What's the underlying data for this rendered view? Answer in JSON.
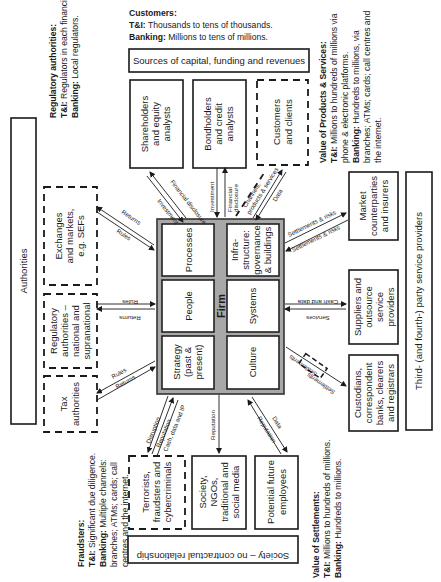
{
  "orientation": "rotated-90-counterclockwise",
  "notes": {
    "customers": {
      "title": "Customers:",
      "line1_bold": "T&I:",
      "line1": " Thousands to tens of thousands.",
      "line2_bold": "Banking:",
      "line2": " Millions to tens of millions."
    },
    "regulatory": {
      "title": "Regulatory authorities:",
      "line1_bold": "T&I:",
      "line1": " Regulators in each financial centre.",
      "line2_bold": "Banking:",
      "line2": " Local regulators."
    },
    "products": {
      "title": "Value of Products & Services:",
      "line1_bold": "T&I:",
      "line1": " Millions to hundreds of millions via",
      "line2": "phone & electronic platforms.",
      "line3_bold": "Banking:",
      "line3": " Hundreds to millions, via",
      "line4": "branches; ATMs; cards; call centres and",
      "line5": "the internet."
    },
    "fraudsters": {
      "title": "Fraudsters:",
      "line1_bold": "T&I:",
      "line1": " Significant due diligence.",
      "line2_bold": "Banking:",
      "line2": " Multiple channels:",
      "line3": "branches; ATMs; cards; call",
      "line4": "centres and the internet."
    },
    "settlements": {
      "title": "Value of Settlements:",
      "line1_bold": "T&I:",
      "line1": " Millions to hundreds of millions.",
      "line2_bold": "Banking:",
      "line2": " Hundreds to millions."
    }
  },
  "groups": {
    "sources": "Sources of capital, funding and revenues",
    "authorities": "Authorities",
    "third_party": "Third- (and fourth-) party service providers",
    "society": "Society – no contractual relationship"
  },
  "entities": {
    "shareholders": [
      "Shareholders",
      "and equity",
      "analysts"
    ],
    "bondholders": [
      "Bondholders",
      "and credit",
      "analysts"
    ],
    "customers": [
      "Customers",
      "and clients"
    ],
    "exchanges": [
      "Exchanges",
      "and markets,",
      "e.g. SEFs"
    ],
    "regulators": [
      "Regulatory",
      "authorities –",
      "national and",
      "supranational"
    ],
    "tax": [
      "Tax",
      "authorities"
    ],
    "market": [
      "Market",
      "counterparties",
      "and insurers"
    ],
    "suppliers": [
      "Suppliers and",
      "outsource",
      "service",
      "providers"
    ],
    "custodians": [
      "Custodians,",
      "correspondent",
      "banks, clearers",
      "and registrars"
    ],
    "terrorists": [
      "Terrorists,",
      "fraudsters and",
      "cybercriminals"
    ],
    "society_media": [
      "Society,",
      "NGOs,",
      "traditional and",
      "social media"
    ],
    "employees": [
      "Potential future",
      "employees"
    ]
  },
  "firm": {
    "label": "Firm",
    "cells": {
      "processes": [
        "Processes"
      ],
      "infrastructure": [
        "Infra-",
        "structure:",
        "governance",
        "& buildings"
      ],
      "people": [
        "People"
      ],
      "systems": [
        "Systems"
      ],
      "strategy": [
        "Strategy",
        "(past &",
        "present)"
      ],
      "culture": [
        "Culture"
      ]
    }
  },
  "flows": {
    "shareholders": [
      "Investment",
      "Financial disclosure"
    ],
    "bondholders": [
      "Investment",
      "Financial",
      "disclosure"
    ],
    "customers": [
      "Channels,",
      "products & services",
      "Data"
    ],
    "exchanges": [
      "Returns",
      "Rules"
    ],
    "regulators": [
      "Rules",
      "Returns"
    ],
    "tax": [
      "Rules",
      "Returns"
    ],
    "market": [
      "Settlements & risks",
      "Settlements & risks"
    ],
    "suppliers": [
      "Cash and data",
      "Services"
    ],
    "custodians": [
      "Settlements",
      "Settlements"
    ],
    "terrorists": [
      "Disruption",
      "Reputation",
      "Cash, data and IP"
    ],
    "society_media": [
      "Reputation"
    ],
    "employees": [
      "Data",
      "Reputation"
    ]
  }
}
